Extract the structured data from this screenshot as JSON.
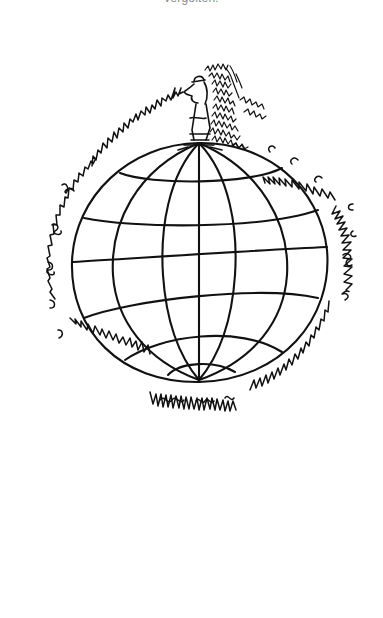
{
  "caption": {
    "text": "vergolten."
  },
  "illustration": {
    "subject": "Cartoon of a man standing on top of a globe, speaking an endless scribbled stream of handwriting that circles the entire globe and piles up behind him",
    "style": "black ink line drawing on white",
    "elements": [
      "man-figure",
      "globe",
      "scribble-speech-ring",
      "scribble-pile"
    ],
    "colors": {
      "ink": "#111111",
      "background": "#ffffff",
      "caption": "#8a8a8a"
    }
  }
}
